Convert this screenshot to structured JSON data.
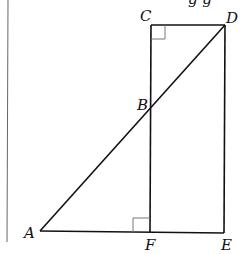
{
  "diagram": {
    "type": "geometry",
    "points": {
      "A": {
        "label": "A",
        "x": 40,
        "y": 231
      },
      "B": {
        "label": "B",
        "x": 151,
        "y": 108
      },
      "C": {
        "label": "C",
        "x": 151,
        "y": 25
      },
      "D": {
        "label": "D",
        "x": 225,
        "y": 25
      },
      "E": {
        "label": "E",
        "x": 224,
        "y": 233
      },
      "F": {
        "label": "F",
        "x": 150,
        "y": 232
      }
    },
    "segments": [
      "CD",
      "CF",
      "DE",
      "AE",
      "AD"
    ],
    "right_angles": [
      "C",
      "F"
    ],
    "top_text_fragment": "g g"
  }
}
